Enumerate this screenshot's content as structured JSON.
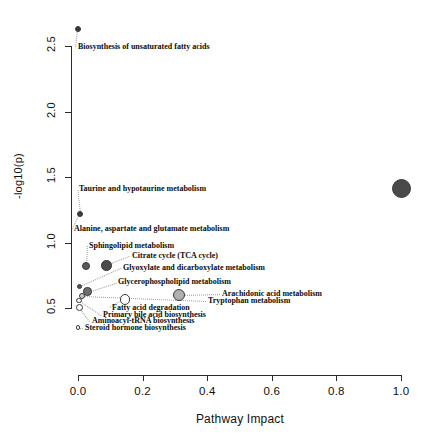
{
  "chart_data": {
    "type": "scatter",
    "title": "",
    "xlabel": "Pathway Impact",
    "ylabel": "-log10(p)",
    "xlim": [
      0.0,
      1.0
    ],
    "ylim": [
      0.3,
      2.72
    ],
    "grid": false,
    "legend": "none",
    "xticks": [
      "0.0",
      "0.2",
      "0.4",
      "0.6",
      "0.8",
      "1.0"
    ],
    "xtick_values": [
      0.0,
      0.2,
      0.4,
      0.6,
      0.8,
      1.0
    ],
    "yticks": [
      "0.5",
      "1.0",
      "1.5",
      "2.0",
      "2.5"
    ],
    "ytick_values": [
      0.5,
      1.0,
      1.5,
      2.0,
      2.5
    ],
    "points": [
      {
        "name": "Biosynthesis of unsaturated fatty acids",
        "x": 0.0,
        "y": 2.63,
        "radius_px": 3.0,
        "fill": "#3a3a3a"
      },
      {
        "name": "Taurine and hypotaurine metabolism",
        "x": 0.005,
        "y": 1.22,
        "radius_px": 3.0,
        "fill": "#3a3a3a"
      },
      {
        "name": "Alanine, aspartate and glutamate metabolism",
        "x": 0.005,
        "y": 1.22,
        "radius_px": 0.0,
        "fill": "#3a3a3a"
      },
      {
        "name": "Linoleic acid metabolism",
        "x": 1.0,
        "y": 1.41,
        "radius_px": 9.5,
        "fill": "#4a4a4a"
      },
      {
        "name": "Sphingolipid metabolism",
        "x": 0.025,
        "y": 0.82,
        "radius_px": 4.0,
        "fill": "#5a5a5a"
      },
      {
        "name": "Citrate cycle (TCA cycle)",
        "x": 0.088,
        "y": 0.825,
        "radius_px": 5.2,
        "fill": "#4a4a4a"
      },
      {
        "name": "Glyoxylate and dicarboxylate metabolism",
        "x": 0.005,
        "y": 0.665,
        "radius_px": 2.6,
        "fill": "#555555"
      },
      {
        "name": "Glycerophospholipid metabolism",
        "x": 0.03,
        "y": 0.625,
        "radius_px": 4.2,
        "fill": "#6e6e6e"
      },
      {
        "name": "Arachidonic acid metabolism",
        "x": 0.313,
        "y": 0.598,
        "radius_px": 6.0,
        "fill": "#b0b0b0"
      },
      {
        "name": "Tryptophan metabolism",
        "x": 0.012,
        "y": 0.59,
        "radius_px": 3.0,
        "fill": "#cccccc"
      },
      {
        "name": "Fatty acid degradation",
        "x": 0.145,
        "y": 0.565,
        "radius_px": 5.2,
        "fill": "#ffffff"
      },
      {
        "name": "Primary bile acid biosynthesis",
        "x": 0.003,
        "y": 0.56,
        "radius_px": 2.6,
        "fill": "#f2f2f2"
      },
      {
        "name": "Aminoacyl-tRNA biosynthesis",
        "x": 0.004,
        "y": 0.505,
        "radius_px": 3.4,
        "fill": "#ffffff"
      },
      {
        "name": "Steroid hormone biosynthesis",
        "x": 0.0,
        "y": 0.35,
        "radius_px": 2.2,
        "fill": "#ffffff"
      }
    ],
    "annotations": [
      {
        "text": "Biosynthesis of unsaturated fatty acids",
        "label_y": 2.49,
        "label_left_px": 78
      },
      {
        "text": "Taurine and hypotaurine metabolism",
        "label_y": 1.405,
        "label_left_px": 79
      },
      {
        "text": "Alanine, aspartate and glutamate metabolism",
        "label_y": 1.1,
        "label_left_px": 74
      },
      {
        "text": "Sphingolipid metabolism",
        "label_y": 0.975,
        "label_left_px": 89
      },
      {
        "text": "Citrate cycle (TCA cycle)",
        "label_y": 0.895,
        "label_left_px": 132
      },
      {
        "text": "Glyoxylate and dicarboxylate metabolism",
        "label_y": 0.805,
        "label_left_px": 123
      },
      {
        "text": "Glycerophospholipid metabolism",
        "label_y": 0.695,
        "label_left_px": 118
      },
      {
        "text": "Arachidonic acid metabolism",
        "label_y": 0.605,
        "label_left_px": 222
      },
      {
        "text": "Tryptophan metabolism",
        "label_y": 0.552,
        "label_left_px": 208
      },
      {
        "text": "Fatty acid degradation",
        "label_y": 0.498,
        "label_left_px": 112
      },
      {
        "text": "Primary bile acid biosynthesis",
        "label_y": 0.445,
        "label_left_px": 103
      },
      {
        "text": "Aminoacyl-tRNA biosynthesis",
        "label_y": 0.398,
        "label_left_px": 92
      },
      {
        "text": "Steroid hormone biosynthesis",
        "label_y": 0.348,
        "label_left_px": 85
      }
    ]
  },
  "axes": {
    "x_title": "Pathway Impact",
    "y_title": "-log10(p)"
  }
}
